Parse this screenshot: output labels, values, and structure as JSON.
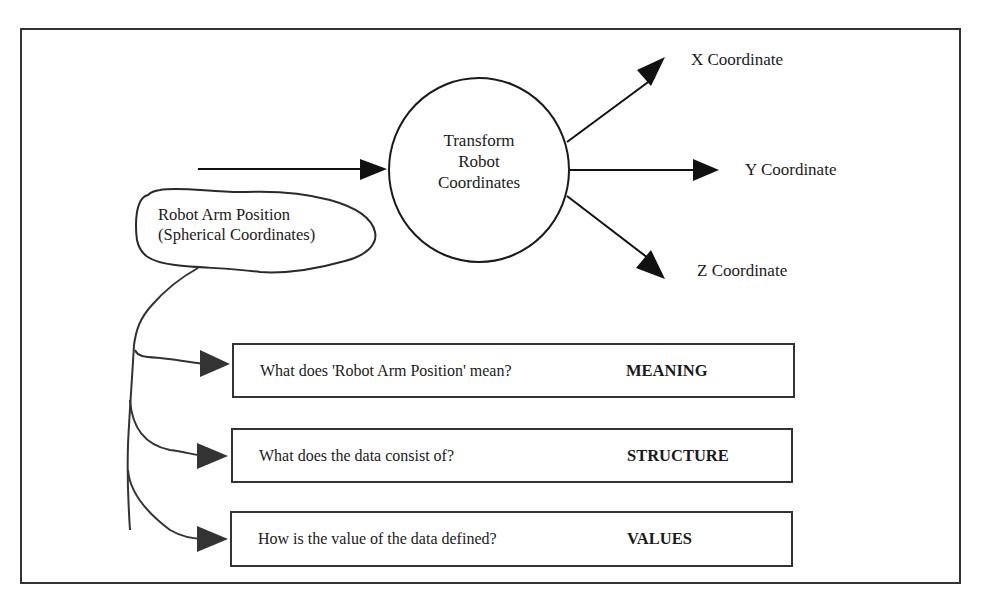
{
  "diagram": {
    "process": {
      "label_lines": [
        "Transform",
        "Robot",
        "Coordinates"
      ]
    },
    "input": {
      "label_lines": [
        "Robot Arm Position",
        "(Spherical Coordinates)"
      ]
    },
    "outputs": [
      {
        "label": "X Coordinate"
      },
      {
        "label": "Y Coordinate"
      },
      {
        "label": "Z Coordinate"
      }
    ],
    "questions": [
      {
        "question": "What does 'Robot Arm Position' mean?",
        "aspect": "MEANING"
      },
      {
        "question": "What does the data consist of?",
        "aspect": "STRUCTURE"
      },
      {
        "question": "How is the value of the data defined?",
        "aspect": "VALUES"
      }
    ],
    "colors": {
      "stroke": "#1a1a1a",
      "arrow_fill": "#111111",
      "callout_arrow_fill": "#333333",
      "background": "#ffffff"
    }
  }
}
